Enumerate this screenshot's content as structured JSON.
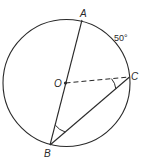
{
  "diagram": {
    "type": "circle-geometry",
    "circle": {
      "center_label": "O"
    },
    "points": {
      "A": {
        "label": "A"
      },
      "B": {
        "label": "B"
      },
      "C": {
        "label": "C"
      },
      "O": {
        "label": "O"
      }
    },
    "arc_label": "50°",
    "segments": [
      {
        "from": "A",
        "to": "B",
        "style": "solid",
        "note": "diameter through O"
      },
      {
        "from": "B",
        "to": "C",
        "style": "solid"
      },
      {
        "from": "O",
        "to": "C",
        "style": "dashed"
      }
    ],
    "marked_angles": [
      "OCB",
      "ABC"
    ],
    "colors": {
      "stroke": "#2a2a2a",
      "background": "#ffffff"
    }
  }
}
